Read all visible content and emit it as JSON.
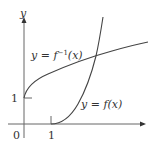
{
  "figure": {
    "axes": {
      "y_label": "y",
      "origin_label": "0",
      "x_tick_label": "1",
      "y_tick_label": "1"
    },
    "curves": {
      "inverse": {
        "label_lhs": "y = ",
        "label_f": "f",
        "label_sup": "−1",
        "label_arg": "(x)"
      },
      "function": {
        "label_lhs": "y = ",
        "label_f": "f",
        "label_arg": "(x)"
      }
    },
    "colors": {
      "axis": "#555555",
      "curve": "#444444",
      "text": "#333333",
      "background": "#ffffff"
    }
  }
}
